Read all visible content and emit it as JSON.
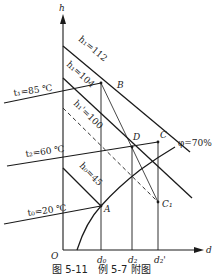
{
  "figure": {
    "caption": "图 5-11　例 5-7 附图",
    "axes": {
      "y_label": "h",
      "x_label": "d",
      "origin_label": "O",
      "x_ticks": [
        "d₀",
        "d₂",
        "d₂'"
      ]
    },
    "enthalpy_lines": {
      "h1_112": "h₁=112",
      "h1_104": "h₁=104",
      "h1p_100": "h₁'=100",
      "h0_45": "h₀=45"
    },
    "temperature_lines": {
      "t1": "t₁=85 ℃",
      "t2": "t₂=60 ℃",
      "t0": "t₀=20 ℃"
    },
    "humidity_curve": "φ=70%",
    "points": {
      "A": "A",
      "B": "B",
      "C": "C",
      "D": "D",
      "C1": "C₁"
    },
    "colors": {
      "line": "#1a1a1a",
      "background": "#ffffff"
    }
  }
}
